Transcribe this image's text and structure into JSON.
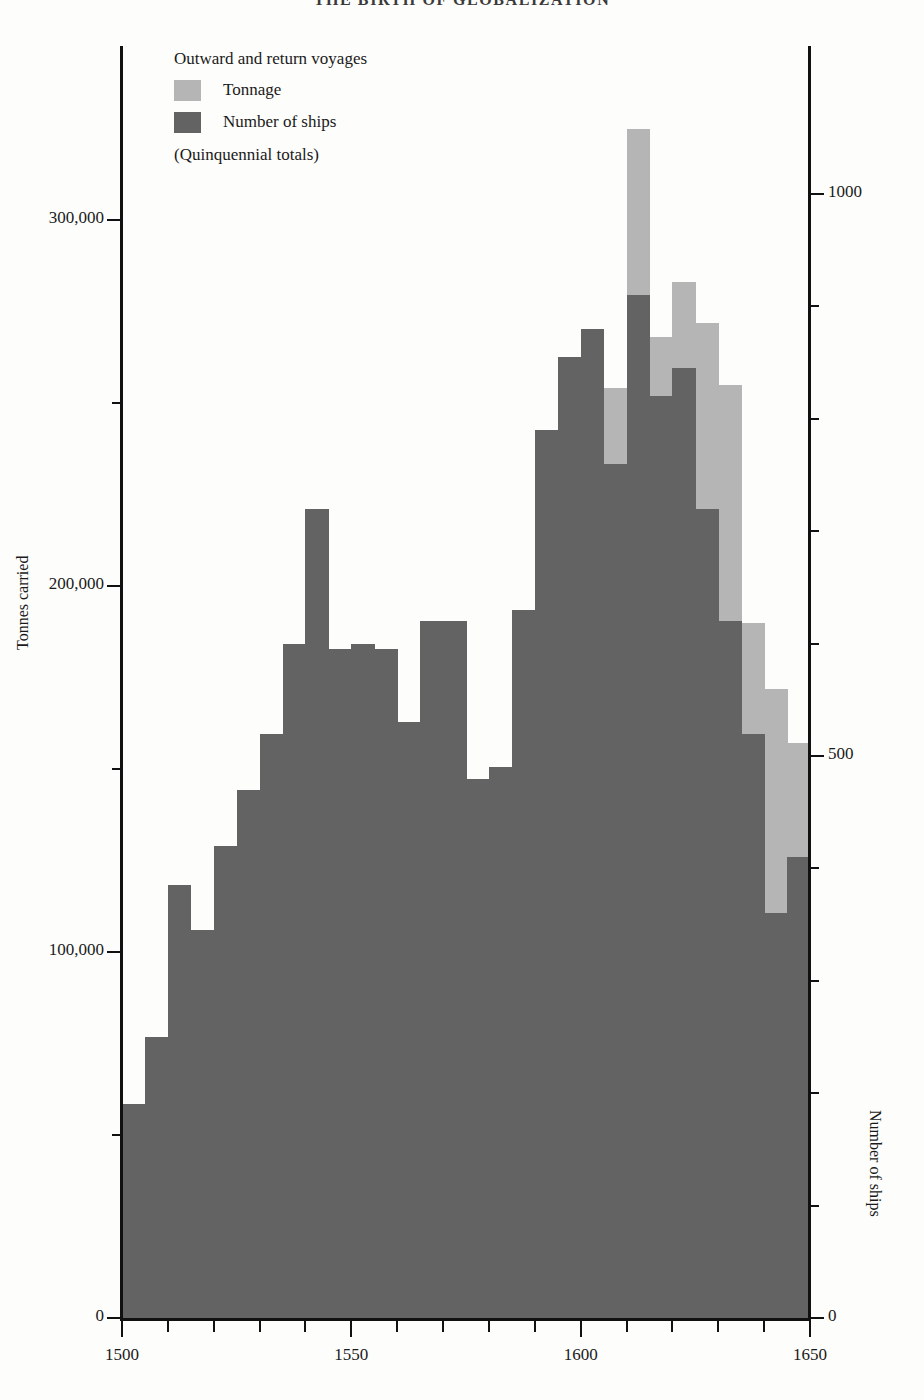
{
  "page": {
    "title": "THE BIRTH OF GLOBALIZATION"
  },
  "legend": {
    "heading": "Outward and return voyages",
    "items": [
      {
        "label": "Tonnage",
        "color": "#b5b5b5",
        "swatch": "tonnage-swatch"
      },
      {
        "label": "Number of ships",
        "color": "#636363",
        "swatch": "ships-swatch"
      }
    ],
    "note": "(Quinquennial totals)"
  },
  "axes": {
    "left": {
      "title": "Tonnes carried",
      "ticks": [
        {
          "label": "300,000",
          "value": 300000,
          "major": true
        },
        {
          "label": "",
          "value": 250000,
          "major": false
        },
        {
          "label": "200,000",
          "value": 200000,
          "major": true
        },
        {
          "label": "",
          "value": 150000,
          "major": false
        },
        {
          "label": "100,000",
          "value": 100000,
          "major": true
        },
        {
          "label": "",
          "value": 50000,
          "major": false
        },
        {
          "label": "0",
          "value": 0,
          "major": true
        }
      ],
      "min": 0,
      "max": 347000
    },
    "right": {
      "title": "Number of ships",
      "ticks": [
        {
          "label": "1000",
          "value": 1000,
          "major": true
        },
        {
          "label": "",
          "value": 900,
          "major": false
        },
        {
          "label": "",
          "value": 800,
          "major": false
        },
        {
          "label": "",
          "value": 700,
          "major": false
        },
        {
          "label": "",
          "value": 600,
          "major": false
        },
        {
          "label": "500",
          "value": 500,
          "major": true
        },
        {
          "label": "",
          "value": 400,
          "major": false
        },
        {
          "label": "",
          "value": 300,
          "major": false
        },
        {
          "label": "",
          "value": 200,
          "major": false
        },
        {
          "label": "",
          "value": 100,
          "major": false
        },
        {
          "label": "0",
          "value": 0,
          "major": true
        }
      ],
      "min": 0,
      "max": 1130
    },
    "bottom": {
      "labels": [
        {
          "label": "1500",
          "value": 1500
        },
        {
          "label": "1550",
          "value": 1550
        },
        {
          "label": "1600",
          "value": 1600
        },
        {
          "label": "1650",
          "value": 1650
        }
      ],
      "tick_step": 10,
      "min": 1500,
      "max": 1650
    }
  },
  "chart_data": {
    "type": "bar",
    "title": "THE BIRTH OF GLOBALIZATION",
    "xlabel": "",
    "ylabel": "Tonnes carried",
    "y2label": "Number of ships",
    "xlim": [
      1500,
      1650
    ],
    "ylim": [
      0,
      347000
    ],
    "y2lim": [
      0,
      1130
    ],
    "grid": false,
    "legend_position": "top-left",
    "note": "(Quinquennial totals); outward and return voyages",
    "categories": [
      "1500-04",
      "1505-09",
      "1510-14",
      "1515-19",
      "1520-24",
      "1525-29",
      "1530-34",
      "1535-39",
      "1540-44",
      "1545-49",
      "1550-54",
      "1555-59",
      "1560-64",
      "1565-69",
      "1570-74",
      "1575-79",
      "1580-84",
      "1585-89",
      "1590-94",
      "1595-99",
      "1600-04",
      "1605-09",
      "1610-14",
      "1615-19",
      "1620-24",
      "1625-29",
      "1630-34",
      "1635-39",
      "1640-44",
      "1645-49"
    ],
    "series": [
      {
        "name": "Tonnage",
        "axis": "left",
        "color": "#b5b5b5",
        "values": [
          13000,
          18000,
          26000,
          25000,
          30000,
          39000,
          47000,
          57000,
          110000,
          87000,
          68000,
          69000,
          80000,
          96000,
          118000,
          132000,
          145000,
          178000,
          220000,
          177000,
          258000,
          254000,
          325000,
          268000,
          283000,
          272000,
          255000,
          190000,
          172000,
          157000
        ]
      },
      {
        "name": "Number of ships",
        "axis": "right",
        "color": "#636363",
        "values": [
          190,
          250,
          385,
          345,
          420,
          470,
          520,
          600,
          720,
          595,
          600,
          595,
          530,
          620,
          620,
          480,
          490,
          630,
          790,
          855,
          880,
          760,
          910,
          820,
          845,
          720,
          620,
          520,
          360,
          410
        ]
      }
    ]
  }
}
